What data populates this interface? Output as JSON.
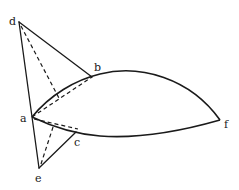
{
  "diagram": {
    "type": "geometry-figure",
    "points": {
      "d": {
        "label": "d",
        "x": 19,
        "y": 22,
        "lx": 9,
        "ly": 23
      },
      "b": {
        "label": "b",
        "x": 92,
        "y": 77,
        "lx": 94,
        "ly": 70
      },
      "a": {
        "label": "a",
        "x": 32,
        "y": 117,
        "lx": 21,
        "ly": 121
      },
      "c": {
        "label": "c",
        "x": 76,
        "y": 132,
        "lx": 74,
        "ly": 145
      },
      "e": {
        "label": "e",
        "x": 39,
        "y": 168,
        "lx": 35,
        "ly": 181
      },
      "f": {
        "label": "f",
        "x": 220,
        "y": 120,
        "lx": 224,
        "ly": 127
      }
    },
    "solid_segments": [
      "d-b",
      "d-a",
      "a-e",
      "e-c"
    ],
    "dashed_segments": [
      "d-(interior)",
      "a-b",
      "a-c",
      "e-(interior)"
    ],
    "curves": [
      "a-b-f upper arc",
      "a-c-f lower arc"
    ],
    "line_color": "#1a1a1a",
    "background": "#ffffff"
  }
}
